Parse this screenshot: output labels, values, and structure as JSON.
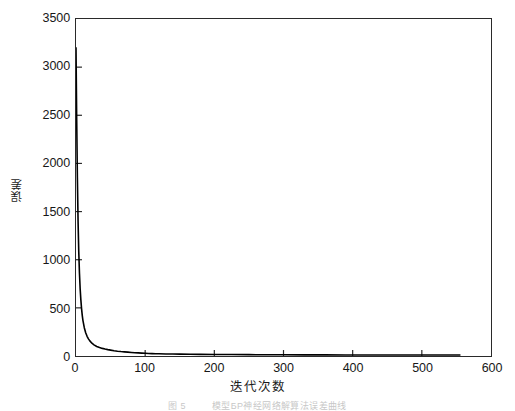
{
  "figure": {
    "caption_label": "图 5",
    "caption_text": "模型БР神经网络解算法误差曲线",
    "background_color": "#ffffff",
    "line_color": "#000000"
  },
  "chart_data": {
    "type": "line",
    "title": "",
    "subtitle": "",
    "xlabel": "迭代次数",
    "ylabel": "误差",
    "xlim": [
      0,
      600
    ],
    "ylim": [
      0,
      3500
    ],
    "xticks": [
      0,
      100,
      200,
      300,
      400,
      500,
      600
    ],
    "yticks": [
      0,
      500,
      1000,
      1500,
      2000,
      2500,
      3000,
      3500
    ],
    "grid": false,
    "legend": null,
    "tick_direction": "in",
    "series": [
      {
        "name": "误差",
        "color": "#000000",
        "line_width": 1.6,
        "x": [
          0,
          1,
          2,
          3,
          4,
          5,
          6,
          7,
          8,
          9,
          10,
          12,
          14,
          16,
          18,
          20,
          23,
          26,
          30,
          34,
          38,
          42,
          46,
          50,
          55,
          60,
          65,
          70,
          75,
          80,
          85,
          90,
          95,
          100,
          105,
          110,
          115,
          120,
          130,
          140,
          150,
          165,
          180,
          200,
          225,
          250,
          275,
          300,
          330,
          360,
          390,
          420,
          450,
          480,
          510,
          535,
          555
        ],
        "y": [
          3200,
          2450,
          1850,
          1400,
          1080,
          860,
          700,
          585,
          495,
          425,
          370,
          294,
          242,
          205,
          178,
          157,
          133,
          116,
          99,
          88,
          79,
          72,
          66,
          61,
          55,
          50,
          46,
          43,
          40,
          37,
          34,
          32,
          30,
          28,
          26,
          25,
          24,
          23,
          21,
          20,
          19,
          18,
          17,
          16,
          15,
          14,
          13,
          13,
          12,
          12,
          11,
          11,
          11,
          10,
          10,
          10,
          10
        ]
      }
    ],
    "annotations": [
      {
        "text": "曲线在约 555 次迭代处终止",
        "visible_as": "line ends before x=600"
      }
    ]
  }
}
